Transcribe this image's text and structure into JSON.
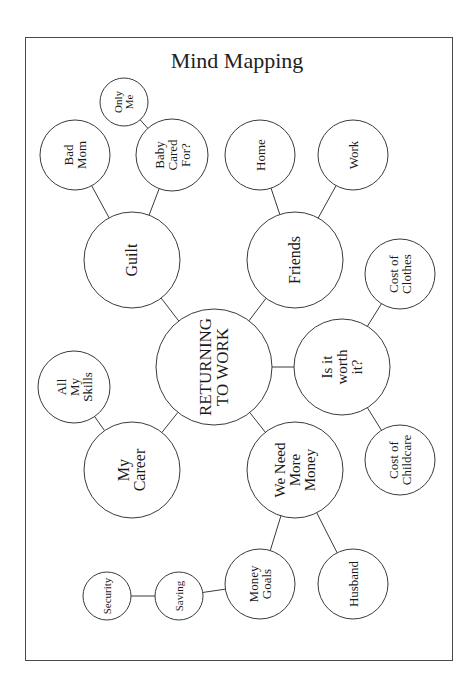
{
  "title": "Mind Mapping",
  "colors": {
    "stroke": "#3a3a3a",
    "fill": "#ffffff",
    "text": "#1a1a1a"
  },
  "nodes": [
    {
      "id": "center",
      "label": "RETURNING\nTO WORK",
      "cx": 214,
      "cy": 367,
      "r": 58,
      "fs": 17,
      "w": 114
    },
    {
      "id": "guilt",
      "label": "Guilt",
      "cx": 132,
      "cy": 260,
      "r": 48,
      "fs": 16,
      "w": 90
    },
    {
      "id": "friends",
      "label": "Friends",
      "cx": 295,
      "cy": 260,
      "r": 48,
      "fs": 16,
      "w": 90
    },
    {
      "id": "career",
      "label": "My\nCareer",
      "cx": 132,
      "cy": 470,
      "r": 48,
      "fs": 16,
      "w": 90
    },
    {
      "id": "money",
      "label": "We Need\nMore\nMoney",
      "cx": 295,
      "cy": 470,
      "r": 48,
      "fs": 15,
      "w": 90
    },
    {
      "id": "worth",
      "label": "Is it\nworth\nit?",
      "cx": 342,
      "cy": 367,
      "r": 48,
      "fs": 15,
      "w": 90
    },
    {
      "id": "badmom",
      "label": "Bad\nMom",
      "cx": 75,
      "cy": 155,
      "r": 35,
      "fs": 13,
      "w": 66
    },
    {
      "id": "baby",
      "label": "Baby\nCared\nFor?",
      "cx": 172,
      "cy": 155,
      "r": 36,
      "fs": 13,
      "w": 66
    },
    {
      "id": "onlyme",
      "label": "Only\nMe",
      "cx": 124,
      "cy": 102,
      "r": 24,
      "fs": 11,
      "w": 44
    },
    {
      "id": "home",
      "label": "Home",
      "cx": 260,
      "cy": 155,
      "r": 35,
      "fs": 13,
      "w": 66
    },
    {
      "id": "work",
      "label": "Work",
      "cx": 353,
      "cy": 155,
      "r": 35,
      "fs": 13,
      "w": 66
    },
    {
      "id": "skills",
      "label": "All\nMy\nSkills",
      "cx": 74,
      "cy": 387,
      "r": 36,
      "fs": 13,
      "w": 66
    },
    {
      "id": "clothes",
      "label": "Cost of\nClothes",
      "cx": 400,
      "cy": 274,
      "r": 35,
      "fs": 13,
      "w": 66
    },
    {
      "id": "childcare",
      "label": "Cost of\nChildcare",
      "cx": 400,
      "cy": 460,
      "r": 35,
      "fs": 13,
      "w": 66
    },
    {
      "id": "goals",
      "label": "Money\nGoals",
      "cx": 260,
      "cy": 584,
      "r": 35,
      "fs": 13,
      "w": 66
    },
    {
      "id": "husband",
      "label": "Husband",
      "cx": 353,
      "cy": 584,
      "r": 35,
      "fs": 13,
      "w": 66
    },
    {
      "id": "saving",
      "label": "Saving",
      "cx": 179,
      "cy": 596,
      "r": 24,
      "fs": 11,
      "w": 46
    },
    {
      "id": "security",
      "label": "Security",
      "cx": 107,
      "cy": 596,
      "r": 24,
      "fs": 11,
      "w": 46
    }
  ],
  "edges": [
    [
      "center",
      "guilt"
    ],
    [
      "center",
      "friends"
    ],
    [
      "center",
      "career"
    ],
    [
      "center",
      "money"
    ],
    [
      "center",
      "worth"
    ],
    [
      "guilt",
      "badmom"
    ],
    [
      "guilt",
      "baby"
    ],
    [
      "baby",
      "onlyme"
    ],
    [
      "friends",
      "home"
    ],
    [
      "friends",
      "work"
    ],
    [
      "career",
      "skills"
    ],
    [
      "worth",
      "clothes"
    ],
    [
      "worth",
      "childcare"
    ],
    [
      "money",
      "goals"
    ],
    [
      "money",
      "husband"
    ],
    [
      "goals",
      "saving"
    ],
    [
      "saving",
      "security"
    ]
  ]
}
